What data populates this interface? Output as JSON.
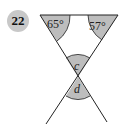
{
  "problem": {
    "number": "22"
  },
  "angles": {
    "top_left": "65°",
    "top_right": "57°",
    "upper_vertical": "c",
    "lower_vertical": "d"
  },
  "colors": {
    "shade": "#bdbdbd",
    "line": "#222222",
    "badge": "#c8c8c8"
  }
}
